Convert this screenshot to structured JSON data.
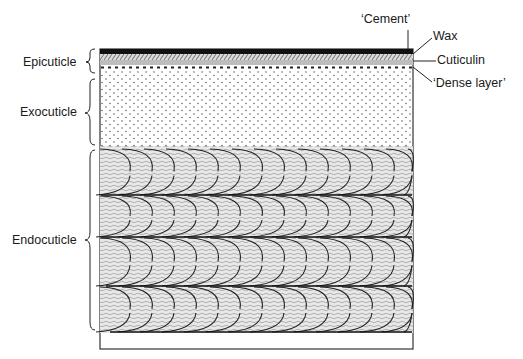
{
  "diagram": {
    "type": "cross-section",
    "left_labels": [
      {
        "id": "epicuticle",
        "text": "Epicuticle"
      },
      {
        "id": "exocuticle",
        "text": "Exocuticle"
      },
      {
        "id": "endocuticle",
        "text": "Endocuticle"
      }
    ],
    "right_labels": [
      {
        "id": "cement",
        "text": "‘Cement’"
      },
      {
        "id": "wax",
        "text": "Wax"
      },
      {
        "id": "cuticulin",
        "text": "Cuticulin"
      },
      {
        "id": "dense-layer",
        "text": "‘Dense layer’"
      }
    ],
    "colors": {
      "ink": "#1a1a1a",
      "cement": "#111111",
      "cuticulin": "#bdbdbd",
      "endocuticle_fill": "#e6e6e6"
    }
  }
}
